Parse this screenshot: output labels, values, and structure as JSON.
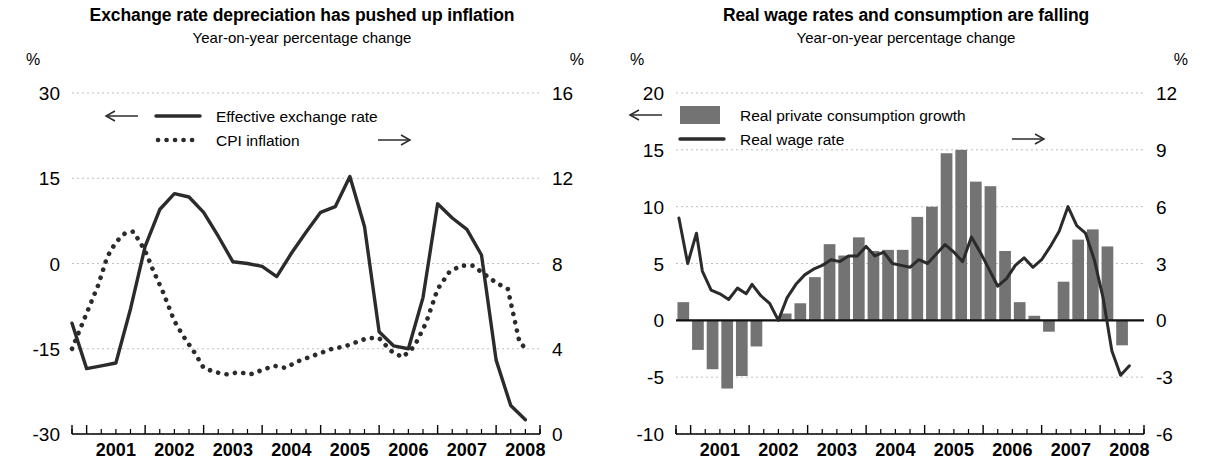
{
  "figure": {
    "panels": [
      {
        "id": "left",
        "title": "Exchange rate depreciation has pushed up inflation",
        "subtitle": "Year-on-year percentage change",
        "left_unit": "%",
        "right_unit": "%",
        "legend": [
          {
            "label": "Effective exchange rate",
            "marker": "solid-line",
            "axis": "left",
            "arrow": "←"
          },
          {
            "label": "CPI inflation",
            "marker": "dotted-line",
            "axis": "right",
            "arrow": "→"
          }
        ]
      },
      {
        "id": "right",
        "title": "Real wage rates and consumption are falling",
        "subtitle": "Year-on-year percentage change",
        "left_unit": "%",
        "right_unit": "%",
        "legend": [
          {
            "label": "Real private consumption growth",
            "marker": "bar-swatch",
            "axis": "left",
            "arrow": "←"
          },
          {
            "label": "Real wage rate",
            "marker": "solid-line",
            "axis": "right",
            "arrow": "→"
          }
        ]
      }
    ],
    "colors": {
      "bar": "#737373",
      "line": "#2b2b2b",
      "grid": "#bfbfbf",
      "axis": "#000000"
    }
  },
  "chart_data": [
    {
      "type": "line",
      "id": "exchange-rate-cpi",
      "title": "Exchange rate depreciation has pushed up inflation",
      "subtitle": "Year-on-year percentage change",
      "xlabel": "",
      "ylabel": "%",
      "y2label": "%",
      "grid": true,
      "legend_position": "top-left",
      "x_tick_labels": [
        "2001",
        "2002",
        "2003",
        "2004",
        "2005",
        "2006",
        "2007",
        "2008"
      ],
      "x_range": [
        2000.75,
        2008.75
      ],
      "ylim": [
        -30,
        30
      ],
      "yticks": [
        -30,
        -15,
        0,
        15,
        30
      ],
      "y2lim": [
        0,
        16
      ],
      "y2ticks": [
        0,
        4,
        8,
        12,
        16
      ],
      "series": [
        {
          "name": "Effective exchange rate",
          "axis": "left",
          "style": "solid",
          "x": [
            2000.75,
            2001.0,
            2001.25,
            2001.5,
            2001.75,
            2002.0,
            2002.25,
            2002.5,
            2002.75,
            2003.0,
            2003.25,
            2003.5,
            2003.75,
            2004.0,
            2004.25,
            2004.5,
            2004.75,
            2005.0,
            2005.25,
            2005.5,
            2005.75,
            2006.0,
            2006.25,
            2006.5,
            2006.75,
            2007.0,
            2007.25,
            2007.5,
            2007.75,
            2008.0,
            2008.25,
            2008.5
          ],
          "y": [
            -10.5,
            -18.5,
            -18.0,
            -17.5,
            -8.0,
            3.0,
            9.5,
            12.3,
            11.7,
            9.0,
            4.8,
            0.3,
            0.0,
            -0.5,
            -2.3,
            1.8,
            5.5,
            9.0,
            10.0,
            15.3,
            6.5,
            -12.0,
            -14.5,
            -15.0,
            -6.0,
            10.5,
            8.0,
            6.0,
            1.5,
            -17.0,
            -25.0,
            -27.5
          ]
        },
        {
          "name": "CPI inflation",
          "axis": "right",
          "style": "dotted",
          "x": [
            2000.75,
            2000.9,
            2001.05,
            2001.2,
            2001.35,
            2001.5,
            2001.65,
            2001.8,
            2002.0,
            2002.15,
            2002.3,
            2002.5,
            2002.65,
            2002.85,
            2003.0,
            2003.2,
            2003.4,
            2003.6,
            2003.8,
            2004.0,
            2004.2,
            2004.4,
            2004.6,
            2004.8,
            2005.0,
            2005.2,
            2005.4,
            2005.6,
            2005.8,
            2006.0,
            2006.2,
            2006.4,
            2006.6,
            2006.8,
            2007.0,
            2007.2,
            2007.4,
            2007.6,
            2007.8,
            2008.0,
            2008.2,
            2008.4,
            2008.55
          ],
          "y": [
            4.0,
            5.0,
            6.0,
            7.0,
            8.3,
            9.0,
            9.4,
            9.5,
            8.6,
            7.6,
            6.7,
            5.3,
            4.6,
            3.8,
            3.1,
            2.9,
            2.8,
            2.9,
            2.8,
            3.0,
            3.2,
            3.1,
            3.4,
            3.6,
            3.8,
            4.0,
            4.1,
            4.3,
            4.5,
            4.5,
            3.9,
            3.6,
            4.1,
            5.2,
            6.8,
            7.6,
            7.9,
            7.9,
            7.5,
            7.1,
            6.8,
            4.3,
            3.9
          ]
        }
      ]
    },
    {
      "type": "bar+line",
      "id": "real-wage-consumption",
      "title": "Real wage rates and consumption are falling",
      "subtitle": "Year-on-year percentage change",
      "xlabel": "",
      "ylabel": "%",
      "y2label": "%",
      "grid": true,
      "legend_position": "top-left",
      "x_tick_labels": [
        "2001",
        "2002",
        "2003",
        "2004",
        "2005",
        "2006",
        "2007",
        "2008"
      ],
      "x_range": [
        2000.75,
        2008.75
      ],
      "ylim": [
        -10,
        20
      ],
      "yticks": [
        -10,
        -5,
        0,
        5,
        10,
        15,
        20
      ],
      "y2lim": [
        -6,
        12
      ],
      "y2ticks": [
        -6,
        -3,
        0,
        3,
        6,
        9,
        12
      ],
      "series": [
        {
          "name": "Real private consumption growth",
          "axis": "left",
          "style": "bar",
          "x": [
            2000.875,
            2001.125,
            2001.375,
            2001.625,
            2001.875,
            2002.125,
            2002.375,
            2002.625,
            2002.875,
            2003.125,
            2003.375,
            2003.625,
            2003.875,
            2004.125,
            2004.375,
            2004.625,
            2004.875,
            2005.125,
            2005.375,
            2005.625,
            2005.875,
            2006.125,
            2006.375,
            2006.625,
            2006.875,
            2007.125,
            2007.375,
            2007.625,
            2007.875,
            2008.125,
            2008.375
          ],
          "y": [
            1.6,
            -2.6,
            -4.3,
            -6.0,
            -4.9,
            -2.3,
            0.0,
            0.6,
            1.5,
            3.8,
            6.7,
            5.7,
            7.3,
            6.1,
            6.2,
            6.2,
            9.1,
            10.0,
            14.7,
            15.0,
            12.2,
            11.8,
            6.1,
            1.6,
            0.4,
            -1.0,
            3.4,
            7.1,
            8.0,
            6.5,
            -2.2
          ]
        },
        {
          "name": "Real wage rate",
          "axis": "right",
          "style": "solid",
          "x": [
            2000.8,
            2000.95,
            2001.1,
            2001.2,
            2001.35,
            2001.5,
            2001.65,
            2001.8,
            2001.95,
            2002.05,
            2002.2,
            2002.35,
            2002.5,
            2002.65,
            2002.8,
            2002.95,
            2003.1,
            2003.25,
            2003.4,
            2003.55,
            2003.7,
            2003.85,
            2004.0,
            2004.15,
            2004.3,
            2004.45,
            2004.6,
            2004.75,
            2004.9,
            2005.05,
            2005.2,
            2005.35,
            2005.5,
            2005.65,
            2005.8,
            2005.95,
            2006.1,
            2006.25,
            2006.4,
            2006.55,
            2006.7,
            2006.85,
            2007.0,
            2007.15,
            2007.3,
            2007.45,
            2007.6,
            2007.75,
            2007.9,
            2008.05,
            2008.2,
            2008.35,
            2008.5
          ],
          "y": [
            5.4,
            3.0,
            4.6,
            2.6,
            1.6,
            1.4,
            1.1,
            1.7,
            1.4,
            1.9,
            1.3,
            0.9,
            0.0,
            1.2,
            1.9,
            2.4,
            2.7,
            2.9,
            3.2,
            3.1,
            3.4,
            3.4,
            3.9,
            3.4,
            3.6,
            3.0,
            2.9,
            2.8,
            3.2,
            3.0,
            3.5,
            4.0,
            3.6,
            3.1,
            4.4,
            3.6,
            2.7,
            1.8,
            2.2,
            2.9,
            3.3,
            2.8,
            3.2,
            3.9,
            4.7,
            6.0,
            5.0,
            4.6,
            3.2,
            1.2,
            -1.6,
            -2.9,
            -2.4,
            -3.6
          ]
        }
      ]
    }
  ]
}
